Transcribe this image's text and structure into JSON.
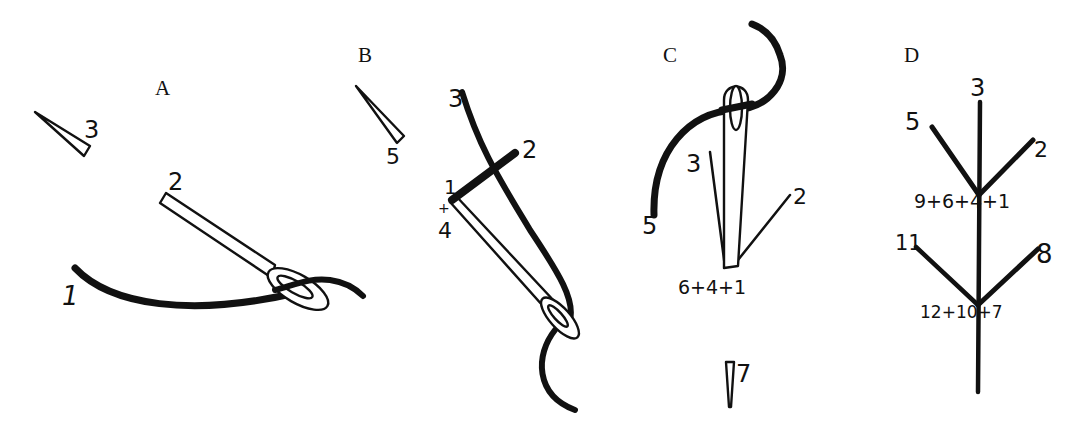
{
  "figure": {
    "background": "#ffffff",
    "ink_color": "#111111",
    "panels": {
      "A": {
        "letter": "A",
        "labels": {
          "p1": "1",
          "p2": "2",
          "p3": "3"
        }
      },
      "B": {
        "letter": "B",
        "labels": {
          "p1": "1",
          "plus": "+",
          "p4": "4",
          "p2": "2",
          "p3": "3",
          "p5": "5"
        }
      },
      "C": {
        "letter": "C",
        "labels": {
          "p3": "3",
          "p2": "2",
          "p5": "5",
          "combo": "6+4+1",
          "p7": "7"
        }
      },
      "D": {
        "letter": "D",
        "labels": {
          "p3": "3",
          "p5": "5",
          "p2": "2",
          "combo_upper": "9+6+4+1",
          "p11": "11",
          "p8": "8",
          "combo_lower": "12+10+7"
        }
      }
    }
  }
}
